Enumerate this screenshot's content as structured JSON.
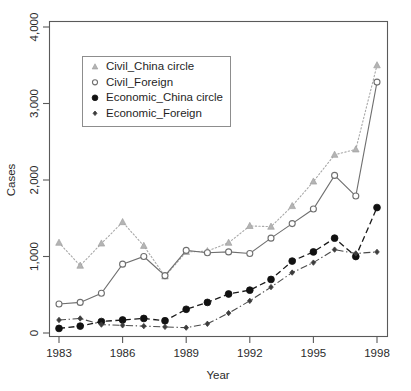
{
  "chart_data": {
    "type": "line",
    "title": "",
    "xlabel": "Year",
    "ylabel": "Cases",
    "xlim": [
      1983,
      1998
    ],
    "ylim": [
      0,
      4000
    ],
    "xticks": [
      1983,
      1986,
      1989,
      1992,
      1995,
      1998
    ],
    "xtick_labels": [
      "1983",
      "1986",
      "1989",
      "1992",
      "1995",
      "1998"
    ],
    "yticks": [
      0,
      1000,
      2000,
      3000,
      4000
    ],
    "ytick_labels": [
      "0",
      "1,000",
      "2,000",
      "3,000",
      "4,000"
    ],
    "grid": false,
    "legend_position": "top-left",
    "x": [
      1983,
      1984,
      1985,
      1986,
      1987,
      1988,
      1989,
      1990,
      1991,
      1992,
      1993,
      1994,
      1995,
      1996,
      1997,
      1998
    ],
    "series": [
      {
        "name": "Civil_China circle",
        "marker": "triangle",
        "color": "#b4b4b4",
        "linestyle": "dotted",
        "values": [
          1180,
          880,
          1170,
          1450,
          1140,
          740,
          1060,
          1070,
          1180,
          1400,
          1390,
          1660,
          1980,
          2330,
          2400,
          3500
        ]
      },
      {
        "name": "Civil_Foreign",
        "marker": "open-circle",
        "color": "#6f6f6f",
        "linestyle": "solid",
        "values": [
          380,
          400,
          520,
          900,
          1000,
          750,
          1080,
          1050,
          1060,
          1040,
          1240,
          1430,
          1620,
          2060,
          1790,
          3280
        ]
      },
      {
        "name": "Economic_China circle",
        "marker": "filled-circle",
        "color": "#111111",
        "linestyle": "dashed",
        "values": [
          60,
          90,
          150,
          170,
          190,
          160,
          310,
          400,
          510,
          560,
          700,
          940,
          1060,
          1240,
          1000,
          1640
        ]
      },
      {
        "name": "Economic_Foreign",
        "marker": "diamond",
        "color": "#3c3c3c",
        "linestyle": "dashdot",
        "values": [
          170,
          190,
          110,
          100,
          90,
          80,
          70,
          120,
          260,
          420,
          600,
          790,
          920,
          1090,
          1040,
          1060
        ]
      }
    ]
  },
  "legend": {
    "items": [
      {
        "label": "Civil_China circle",
        "marker": "triangle"
      },
      {
        "label": "Civil_Foreign",
        "marker": "open-circle"
      },
      {
        "label": "Economic_China circle",
        "marker": "filled-circle"
      },
      {
        "label": "Economic_Foreign",
        "marker": "diamond"
      }
    ]
  },
  "axes": {
    "x_title": "Year",
    "y_title": "Cases"
  }
}
